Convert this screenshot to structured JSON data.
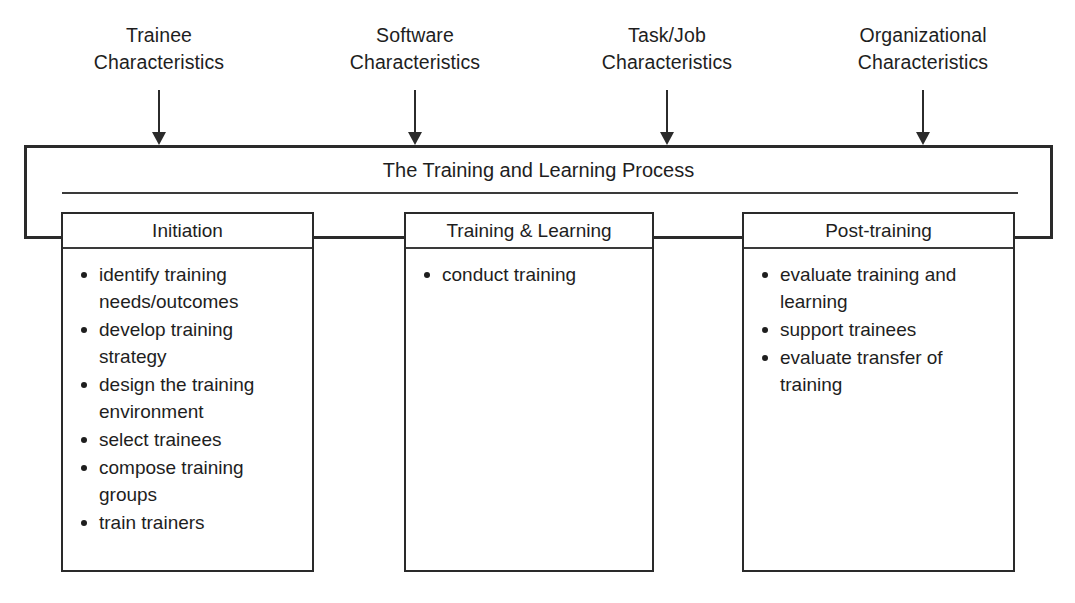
{
  "diagram": {
    "title": "The Training and Learning Process",
    "inputs": [
      {
        "line1": "Trainee",
        "line2": "Characteristics",
        "arrow_x": 159,
        "center_x": 159
      },
      {
        "line1": "Software",
        "line2": "Characteristics",
        "arrow_x": 415,
        "center_x": 415
      },
      {
        "line1": "Task/Job",
        "line2": "Characteristics",
        "arrow_x": 667,
        "center_x": 667
      },
      {
        "line1": "Organizational",
        "line2": "Characteristics",
        "arrow_x": 923,
        "center_x": 923
      }
    ],
    "phases": [
      {
        "title": "Initiation",
        "items": [
          "identify training needs/outcomes",
          "develop training strategy",
          "design the training environment",
          "select trainees",
          "compose training groups",
          "train trainers"
        ]
      },
      {
        "title": "Training & Learning",
        "items": [
          "conduct training"
        ]
      },
      {
        "title": "Post-training",
        "items": [
          "evaluate training and learning",
          "support trainees",
          "evaluate transfer of training"
        ]
      }
    ],
    "colors": {
      "background": "#ffffff",
      "line": "#2a2a2a",
      "text": "#1e1e1e"
    }
  }
}
